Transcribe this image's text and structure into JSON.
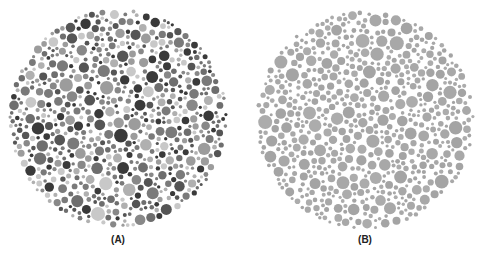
{
  "figure": {
    "panels": [
      {
        "label": "(A)",
        "description": "Color vision test plate with dots of varied gray shades",
        "cx": 118,
        "cy": 118,
        "r": 110,
        "palette": [
          "#3a3a3a",
          "#555555",
          "#6e6e6e",
          "#888888",
          "#9c9c9c",
          "#b0b0b0",
          "#c8c8c8",
          "#7a7a7a"
        ]
      },
      {
        "label": "(B)",
        "description": "Color vision test plate with dots of uniform gray shade",
        "cx": 365,
        "cy": 120,
        "r": 110,
        "palette": [
          "#a8a8a8",
          "#a4a4a4",
          "#acacac"
        ]
      }
    ]
  }
}
